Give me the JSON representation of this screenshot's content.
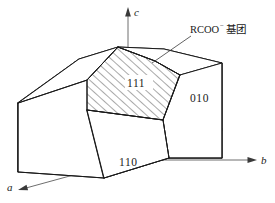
{
  "figure": {
    "background_color": "#ffffff",
    "line_color": "#1a1a1a",
    "hidden_line_color": "#9a9a9a",
    "axis_color": "#5d5d5d"
  },
  "axes": [
    {
      "id": "a",
      "label": "a",
      "direction": "lower-left",
      "arrow": true
    },
    {
      "id": "b",
      "label": "b",
      "direction": "right",
      "arrow": true
    },
    {
      "id": "c",
      "label": "c",
      "direction": "up",
      "arrow": true
    }
  ],
  "face_labels": [
    {
      "id": "face-111",
      "label": "111",
      "hatched": true
    },
    {
      "id": "face-010",
      "label": "010",
      "hatched": false
    },
    {
      "id": "face-110",
      "label": "110",
      "hatched": false
    }
  ],
  "callout": {
    "id": "rcoo-callout",
    "text_main": "RCOO",
    "charge": "−",
    "text_cn": "基团",
    "full": "RCOO⁻基团",
    "leader_to": "face-111"
  }
}
